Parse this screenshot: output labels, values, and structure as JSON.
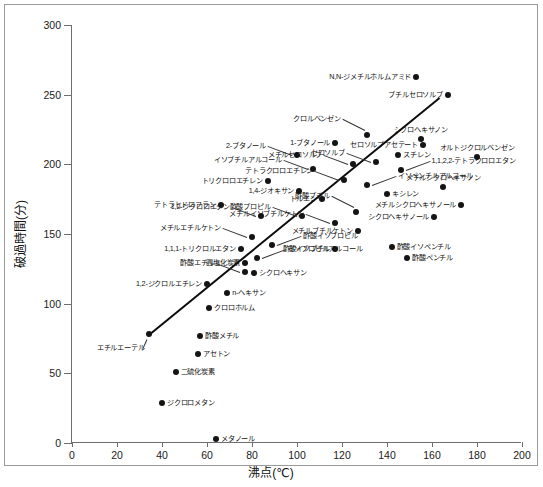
{
  "chart_data": {
    "type": "scatter",
    "title": "",
    "xlabel": "沸点(℃)",
    "ylabel": "破過時間(分)",
    "xlim": [
      0,
      200
    ],
    "ylim": [
      0,
      300
    ],
    "xticks": [
      0,
      20,
      40,
      60,
      80,
      100,
      120,
      140,
      160,
      180,
      200
    ],
    "yticks": [
      0,
      50,
      100,
      150,
      200,
      250,
      300
    ],
    "grid": false,
    "legend": "none",
    "trendline": {
      "x0": 34,
      "y0": 78,
      "x1": 163,
      "y1": 248
    },
    "points": [
      {
        "label": "N,N-ジメチルホルムアミド",
        "x": 153,
        "y": 263,
        "lp": "r"
      },
      {
        "label": "ブチルセロソルブ",
        "x": 167,
        "y": 250,
        "lp": "r"
      },
      {
        "label": "クロルベンゼン",
        "x": 131,
        "y": 221,
        "lp": "leader-ul"
      },
      {
        "label": "シクロヘキサノン",
        "x": 155,
        "y": 218,
        "lp": "c-up"
      },
      {
        "label": "1-ブタノール",
        "x": 117,
        "y": 215,
        "lp": "r"
      },
      {
        "label": "セロソルブアセテート",
        "x": 156,
        "y": 214,
        "lp": "r"
      },
      {
        "label": "スチレン",
        "x": 145,
        "y": 207,
        "lp": "l"
      },
      {
        "label": "オルトジクロルベンゼン",
        "x": 180,
        "y": 205,
        "lp": "c-up"
      },
      {
        "label": "2-ブタノール",
        "x": 100,
        "y": 207,
        "lp": "leader-l"
      },
      {
        "label": "セロソルブ",
        "x": 135,
        "y": 202,
        "lp": "leader-l"
      },
      {
        "label": "メチルセロソルブ",
        "x": 125,
        "y": 200,
        "lp": "leader-l"
      },
      {
        "label": "1,1,2,2-テトラクロロエタン",
        "x": 146,
        "y": 196,
        "lp": "leader-r"
      },
      {
        "label": "イソブチルアルコール",
        "x": 107,
        "y": 197,
        "lp": "leader-l"
      },
      {
        "label": "テトラクロロエチレン",
        "x": 121,
        "y": 189,
        "lp": "leader-l"
      },
      {
        "label": "イソペンチルアルコール",
        "x": 131,
        "y": 185,
        "lp": "leader-r"
      },
      {
        "label": "トリクロロエチレン",
        "x": 87,
        "y": 188,
        "lp": "r"
      },
      {
        "label": "メチルシクロヘキサノン",
        "x": 165,
        "y": 184,
        "lp": "c-up"
      },
      {
        "label": "キシレン",
        "x": 140,
        "y": 179,
        "lp": "l"
      },
      {
        "label": "1,4-ジオキサン",
        "x": 101,
        "y": 181,
        "lp": "r"
      },
      {
        "label": "トルエン",
        "x": 111,
        "y": 175,
        "lp": "r"
      },
      {
        "label": "1,2-ジクロロエタン",
        "x": 84,
        "y": 163,
        "lp": "leader-l"
      },
      {
        "label": "メチルシクロヘキサノール",
        "x": 173,
        "y": 171,
        "lp": "r"
      },
      {
        "label": "テトラヒドロフラン",
        "x": 66,
        "y": 171,
        "lp": "r"
      },
      {
        "label": "酢酸プロピル",
        "x": 102,
        "y": 163,
        "lp": "leader-l"
      },
      {
        "label": "酢酸ブチル",
        "x": 126,
        "y": 166,
        "lp": "leader-ul"
      },
      {
        "label": "シクロヘキサノール",
        "x": 161,
        "y": 162,
        "lp": "r"
      },
      {
        "label": "メチルイソブチルケトン",
        "x": 117,
        "y": 158,
        "lp": "leader-l"
      },
      {
        "label": "メチルブチルケトン",
        "x": 127,
        "y": 152,
        "lp": "r"
      },
      {
        "label": "メチルエチルケトン",
        "x": 80,
        "y": 148,
        "lp": "leader-l"
      },
      {
        "label": "酢酸イソプロピル",
        "x": 89,
        "y": 142,
        "lp": "leader-r"
      },
      {
        "label": "酢酸イソブチル",
        "x": 117,
        "y": 139,
        "lp": "r"
      },
      {
        "label": "酢酸イソペンチル",
        "x": 142,
        "y": 141,
        "lp": "l"
      },
      {
        "label": "1,1,1-トリクロルエタン",
        "x": 75,
        "y": 139,
        "lp": "r"
      },
      {
        "label": "イソプロピルアルコール",
        "x": 82,
        "y": 133,
        "lp": "leader-r"
      },
      {
        "label": "酢酸ペンチル",
        "x": 149,
        "y": 133,
        "lp": "l"
      },
      {
        "label": "四塩化炭素",
        "x": 77,
        "y": 129,
        "lp": "r"
      },
      {
        "label": "酢酸エチル",
        "x": 77,
        "y": 123,
        "lp": "leader-l"
      },
      {
        "label": "シクロヘキサン",
        "x": 81,
        "y": 122,
        "lp": "l"
      },
      {
        "label": "1,2-ジクロルエチレン",
        "x": 60,
        "y": 114,
        "lp": "r"
      },
      {
        "label": "n-ヘキサン",
        "x": 69,
        "y": 108,
        "lp": "l"
      },
      {
        "label": "クロロホルム",
        "x": 61,
        "y": 97,
        "lp": "l"
      },
      {
        "label": "酢酸メチル",
        "x": 57,
        "y": 77,
        "lp": "l"
      },
      {
        "label": "エチルエーテル",
        "x": 34,
        "y": 78,
        "lp": "leader-bl"
      },
      {
        "label": "アセトン",
        "x": 56,
        "y": 64,
        "lp": "l"
      },
      {
        "label": "二硫化炭素",
        "x": 46,
        "y": 51,
        "lp": "l"
      },
      {
        "label": "ジクロロメタン",
        "x": 40,
        "y": 29,
        "lp": "l"
      },
      {
        "label": "メタノール",
        "x": 64,
        "y": 3,
        "lp": "l"
      }
    ]
  },
  "axes": {
    "x_title": "沸点(℃)",
    "y_title": "破過時間(分)"
  },
  "caption": ""
}
